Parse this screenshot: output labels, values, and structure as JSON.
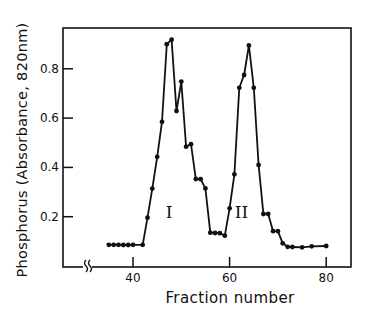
{
  "chart_data": {
    "type": "line",
    "title": "",
    "xlabel": "Fraction number",
    "ylabel": "Phosphorus (Absorbance, 820nm)",
    "xlim": [
      30,
      84
    ],
    "ylim": [
      0,
      0.97
    ],
    "x_ticks": [
      40,
      60,
      80
    ],
    "x_tick_labels": [
      "40",
      "60",
      "80"
    ],
    "y_ticks": [
      0.2,
      0.4,
      0.6,
      0.8
    ],
    "y_tick_labels": [
      "0.2",
      "0.4",
      "0.6",
      "0.8"
    ],
    "grid": false,
    "legend": null,
    "axis_break": "x-axis break between origin and 40",
    "annotations": [
      {
        "text": "I",
        "x": 48.5,
        "y": 0.22
      },
      {
        "text": "II",
        "x": 63.5,
        "y": 0.22
      }
    ],
    "series": [
      {
        "name": "Phosphorus",
        "marker": "filled-circle",
        "x": [
          35,
          36,
          37,
          38,
          39,
          40,
          42,
          43,
          44,
          45,
          46,
          47,
          48,
          49,
          50,
          51,
          52,
          53,
          54,
          55,
          56,
          57,
          58,
          59,
          60,
          61,
          62,
          63,
          64,
          65,
          66,
          67,
          68,
          69,
          70,
          71,
          72,
          73,
          75,
          77,
          80
        ],
        "values": [
          0.086,
          0.086,
          0.086,
          0.085,
          0.085,
          0.086,
          0.086,
          0.196,
          0.314,
          0.443,
          0.585,
          0.9,
          0.918,
          0.629,
          0.748,
          0.484,
          0.494,
          0.353,
          0.352,
          0.315,
          0.135,
          0.134,
          0.133,
          0.123,
          0.234,
          0.372,
          0.723,
          0.775,
          0.895,
          0.723,
          0.41,
          0.211,
          0.211,
          0.141,
          0.141,
          0.092,
          0.078,
          0.077,
          0.076,
          0.08,
          0.081
        ]
      }
    ]
  },
  "labels": {
    "ylabel": "Phosphorus (Absorbance, 820nm)",
    "xlabel": "Fraction number"
  }
}
